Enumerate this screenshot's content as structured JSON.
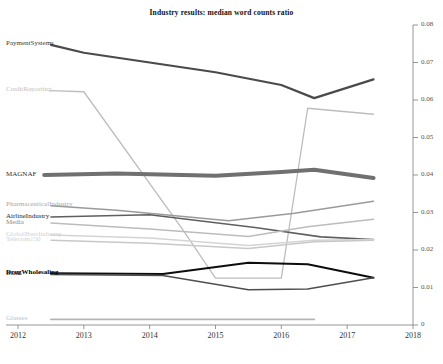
{
  "chart_data": {
    "type": "line",
    "title": "Industry results: median word counts ratio",
    "xlabel": "",
    "ylabel": "",
    "xlim": [
      2012,
      2018
    ],
    "ylim": [
      0,
      0.08
    ],
    "xticks": [
      "2012",
      "2013",
      "2014",
      "2015",
      "2016",
      "2017",
      "2018"
    ],
    "yticks": [
      "0",
      "0.01",
      "0.02",
      "0.03",
      "0.04",
      "0.05",
      "0.06",
      "0.07",
      "0.08"
    ],
    "grid": false,
    "legend": "inline-left-labels",
    "yaxis_position": "right",
    "series": [
      {
        "name": "PaymentSystems",
        "color": "#4a4a4a",
        "width": 2.2,
        "label_color": "#3a3a3a",
        "label_weight": "normal",
        "x": [
          2012.5,
          2013.0,
          2014.0,
          2015.0,
          2016.0,
          2016.5,
          2017.4
        ],
        "values": [
          0.0747,
          0.0726,
          0.07,
          0.0674,
          0.064,
          0.0605,
          0.0655
        ]
      },
      {
        "name": "CreditReporting",
        "color": "#bdbdbd",
        "width": 1.3,
        "label_color": "#c2c2c2",
        "label_weight": "normal",
        "x": [
          2012.5,
          2013.0,
          2014.5,
          2015.0,
          2016.0,
          2016.4,
          2017.4
        ],
        "values": [
          0.0625,
          0.0622,
          0.0255,
          0.0125,
          0.0125,
          0.0578,
          0.0562
        ]
      },
      {
        "name": "MAGNAF",
        "color": "#707070",
        "width": 4.2,
        "label_color": "#2e2e2e",
        "label_weight": "normal",
        "x": [
          2012.4,
          2013.5,
          2015.0,
          2016.0,
          2016.5,
          2017.4
        ],
        "values": [
          0.04,
          0.0404,
          0.0398,
          0.0408,
          0.0414,
          0.0392
        ]
      },
      {
        "name": "PharmaceuticalIndustry",
        "color": "#9a9a9a",
        "width": 1.3,
        "label_color": "#a8a8a8",
        "label_weight": "normal",
        "x": [
          2012.5,
          2013.5,
          2015.2,
          2016.2,
          2017.4
        ],
        "values": [
          0.0318,
          0.0306,
          0.0278,
          0.0298,
          0.033
        ]
      },
      {
        "name": "AirlineIndustry",
        "color": "#5f5f5f",
        "width": 1.6,
        "label_color": "#1f1f1f",
        "label_weight": "normal",
        "x": [
          2012.5,
          2014.0,
          2015.6,
          2016.6,
          2017.4
        ],
        "values": [
          0.0288,
          0.0294,
          0.026,
          0.0235,
          0.0228
        ]
      },
      {
        "name": "Media",
        "color": "#bcbcbc",
        "width": 1.3,
        "label_color": "#8c8c8c",
        "label_weight": "normal",
        "x": [
          2012.5,
          2014.0,
          2015.5,
          2016.4,
          2017.4
        ],
        "values": [
          0.0272,
          0.0256,
          0.0236,
          0.0262,
          0.0282
        ]
      },
      {
        "name": "GlobalBeerIndustry",
        "color": "#d4d4d4",
        "width": 1.3,
        "label_color": "#d2d2d2",
        "label_weight": "normal",
        "x": [
          2012.5,
          2014.0,
          2015.5,
          2016.5,
          2017.4
        ],
        "values": [
          0.024,
          0.0232,
          0.0212,
          0.0226,
          0.0228
        ]
      },
      {
        "name": "Telecom150",
        "color": "#c8c8c8",
        "width": 1.3,
        "label_color": "#cfcfcf",
        "label_weight": "normal",
        "x": [
          2012.5,
          2014.0,
          2015.5,
          2016.5,
          2017.4
        ],
        "values": [
          0.0226,
          0.0218,
          0.0204,
          0.0222,
          0.0226
        ]
      },
      {
        "name": "DrugWholesaling",
        "color": "#0d0d0d",
        "width": 1.9,
        "label_color": "#000000",
        "label_weight": "bold",
        "x": [
          2012.5,
          2014.2,
          2015.5,
          2016.4,
          2017.4
        ],
        "values": [
          0.0138,
          0.0136,
          0.0166,
          0.0162,
          0.0126
        ]
      },
      {
        "name": "Bank",
        "color": "#4f4f4f",
        "width": 1.7,
        "label_color": "#222222",
        "label_weight": "normal",
        "x": [
          2012.5,
          2014.2,
          2015.5,
          2016.4,
          2017.4
        ],
        "values": [
          0.0135,
          0.0132,
          0.0094,
          0.0096,
          0.0126
        ]
      },
      {
        "name": "Glasses",
        "color": "#b5b5b5",
        "width": 1.8,
        "label_color": "#c0c0c0",
        "label_weight": "normal",
        "x": [
          2012.5,
          2016.5
        ],
        "values": [
          0.0015,
          0.0015
        ]
      }
    ]
  }
}
